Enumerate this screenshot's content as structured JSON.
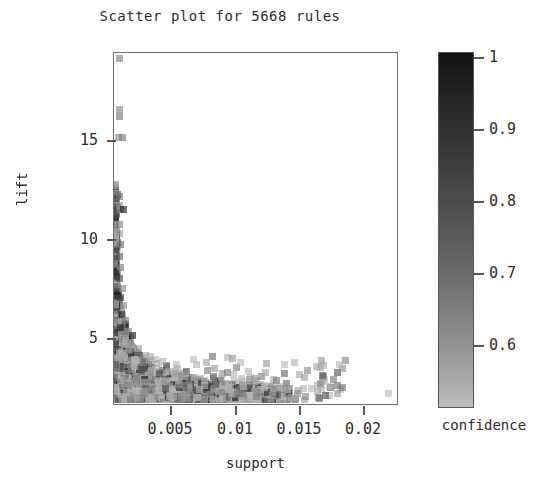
{
  "chart": {
    "title": "Scatter plot for 5668 rules",
    "xlabel": "support",
    "ylabel": "lift",
    "colorbar_title": "confidence"
  },
  "chart_data": {
    "type": "scatter",
    "title": "Scatter plot for 5668 rules",
    "xlabel": "support",
    "ylabel": "lift",
    "n_rules": 5668,
    "grid": false,
    "legend": "colorbar-right",
    "xlim": [
      0.0008,
      0.0235
    ],
    "ylim": [
      1.0,
      19.6
    ],
    "xticks": [
      0.005,
      0.01,
      0.015,
      0.02
    ],
    "xticklabels": [
      "0.005",
      "0.01",
      "0.015",
      "0.02"
    ],
    "yticks": [
      5,
      10,
      15
    ],
    "yticklabels": [
      "5",
      "10",
      "15"
    ],
    "colorbar": {
      "label": "confidence",
      "ticks": [
        0.6,
        0.7,
        0.8,
        0.9,
        1
      ],
      "ticklabels": [
        "0.6",
        "0.7",
        "0.8",
        "0.9",
        "1"
      ],
      "vmin": 0.54,
      "vmax": 1.0,
      "cmap": "grey-dark-high",
      "color_high": "#131313",
      "color_low": "#bdbdbd"
    },
    "marker": {
      "shape": "square",
      "size_px": 7,
      "alpha": 0.62
    },
    "points": [
      {
        "support": 0.00125,
        "lift": 19.3,
        "confidence": 0.72
      },
      {
        "support": 0.00122,
        "lift": 16.6,
        "confidence": 0.7
      },
      {
        "support": 0.00128,
        "lift": 16.2,
        "confidence": 0.74
      },
      {
        "support": 0.0012,
        "lift": 15.1,
        "confidence": 0.68
      },
      {
        "support": 0.0015,
        "lift": 15.1,
        "confidence": 0.73
      },
      {
        "support": 0.00121,
        "lift": 12.0,
        "confidence": 0.76
      },
      {
        "support": 0.00124,
        "lift": 11.5,
        "confidence": 0.67
      },
      {
        "support": 0.0013,
        "lift": 11.3,
        "confidence": 0.69
      },
      {
        "support": 0.0016,
        "lift": 11.3,
        "confidence": 0.98
      },
      {
        "support": 0.00123,
        "lift": 10.5,
        "confidence": 0.71
      },
      {
        "support": 0.00126,
        "lift": 10.0,
        "confidence": 0.66
      },
      {
        "support": 0.00135,
        "lift": 9.4,
        "confidence": 0.79
      },
      {
        "support": 0.00124,
        "lift": 8.8,
        "confidence": 0.82
      },
      {
        "support": 0.00132,
        "lift": 8.2,
        "confidence": 0.74
      },
      {
        "support": 0.00128,
        "lift": 7.6,
        "confidence": 0.88
      },
      {
        "support": 0.00145,
        "lift": 7.1,
        "confidence": 0.7
      },
      {
        "support": 0.0013,
        "lift": 6.6,
        "confidence": 0.91
      },
      {
        "support": 0.00155,
        "lift": 6.2,
        "confidence": 0.69
      },
      {
        "support": 0.0014,
        "lift": 5.7,
        "confidence": 0.95
      },
      {
        "support": 0.00175,
        "lift": 5.4,
        "confidence": 0.72
      },
      {
        "support": 0.00135,
        "lift": 5.0,
        "confidence": 0.97
      },
      {
        "support": 0.00195,
        "lift": 4.8,
        "confidence": 0.68
      },
      {
        "support": 0.0023,
        "lift": 4.6,
        "confidence": 0.99
      },
      {
        "support": 0.00215,
        "lift": 4.2,
        "confidence": 0.66
      },
      {
        "support": 0.0028,
        "lift": 3.9,
        "confidence": 0.64
      },
      {
        "support": 0.0033,
        "lift": 3.5,
        "confidence": 0.63
      },
      {
        "support": 0.0042,
        "lift": 3.1,
        "confidence": 0.61
      },
      {
        "support": 0.0052,
        "lift": 2.7,
        "confidence": 0.6
      },
      {
        "support": 0.0065,
        "lift": 2.4,
        "confidence": 0.59
      },
      {
        "support": 0.0081,
        "lift": 2.2,
        "confidence": 0.58
      },
      {
        "support": 0.0096,
        "lift": 2.0,
        "confidence": 0.58
      },
      {
        "support": 0.0112,
        "lift": 1.9,
        "confidence": 0.57
      },
      {
        "support": 0.0129,
        "lift": 1.8,
        "confidence": 0.57
      },
      {
        "support": 0.0148,
        "lift": 1.7,
        "confidence": 0.56
      },
      {
        "support": 0.0229,
        "lift": 1.5,
        "confidence": 0.56
      }
    ]
  }
}
